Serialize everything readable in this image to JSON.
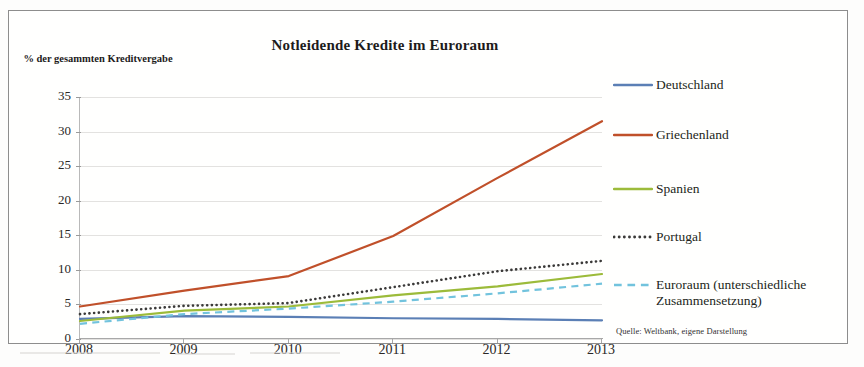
{
  "chart_data": {
    "type": "line",
    "title": "Notleidende Kredite im Euroraum",
    "ylabel": "% der gesammten\nKreditvergabe",
    "xlabel": "",
    "x": [
      2008,
      2009,
      2010,
      2011,
      2012,
      2013
    ],
    "xticklabels": [
      "2008",
      "2009",
      "2010",
      "2011",
      "2012",
      "2013"
    ],
    "yticklabels": [
      "0",
      "5",
      "10",
      "15",
      "20",
      "25",
      "30",
      "35"
    ],
    "yticks": [
      0,
      5,
      10,
      15,
      20,
      25,
      30,
      35
    ],
    "ylim": [
      0,
      35
    ],
    "xlim": [
      2008,
      2013
    ],
    "grid": true,
    "legend_position": "right",
    "source_note": "Quelle: Weltbank, eigene Darstellung",
    "series": [
      {
        "name": "Deutschland",
        "color": "#5b7fb5",
        "style": "solid",
        "values": [
          2.9,
          3.3,
          3.2,
          3.0,
          2.9,
          2.7
        ]
      },
      {
        "name": "Griechenland",
        "color": "#c0502a",
        "style": "solid",
        "values": [
          4.7,
          7.0,
          9.1,
          14.9,
          23.3,
          31.5
        ]
      },
      {
        "name": "Spanien",
        "color": "#9cbb3a",
        "style": "solid",
        "values": [
          2.6,
          4.1,
          4.7,
          6.3,
          7.6,
          9.4
        ]
      },
      {
        "name": "Portugal",
        "color": "#3b3a39",
        "style": "dotted",
        "values": [
          3.6,
          4.8,
          5.2,
          7.5,
          9.8,
          11.3
        ]
      },
      {
        "name": "Euroraum (unterschiedliche\nZusammensetzung)",
        "color": "#72c3dd",
        "style": "dashed",
        "values": [
          2.2,
          3.6,
          4.4,
          5.4,
          6.6,
          8.0
        ]
      }
    ]
  },
  "legend": {
    "items": [
      {
        "label": "Deutschland"
      },
      {
        "label": "Griechenland"
      },
      {
        "label": "Spanien"
      },
      {
        "label": "Portugal"
      },
      {
        "label": "Euroraum (unterschiedliche\nZusammensetzung)"
      }
    ]
  },
  "colors": {
    "deutschland": "#5b7fb5",
    "griechenland": "#c0502a",
    "spanien": "#9cbb3a",
    "portugal": "#3b3a39",
    "euroraum": "#72c3dd",
    "grid": "#e3e2e0",
    "frame": "#8d8d8d"
  }
}
